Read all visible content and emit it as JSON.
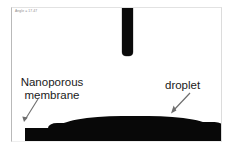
{
  "image": {
    "kind": "contact-angle-goniometer-photo",
    "osd_text": "Angle = 17.47",
    "background_color": "#ffffff",
    "ink_color": "#080808"
  },
  "annotations": [
    {
      "name": "membrane",
      "label": "Nanoporous\nmembrane",
      "arrow_from": [
        38,
        99
      ],
      "arrow_to": [
        24,
        121
      ]
    },
    {
      "name": "droplet",
      "label": "droplet",
      "arrow_from": [
        190,
        93
      ],
      "arrow_to": [
        171,
        113
      ]
    }
  ],
  "objects": {
    "needle_label": "needle",
    "membrane_label": "membrane-slab",
    "droplet_label": "sessile-droplet"
  }
}
